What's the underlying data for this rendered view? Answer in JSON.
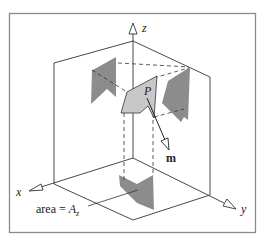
{
  "diagram": {
    "axes": {
      "x_label": "x",
      "y_label": "y",
      "z_label": "z"
    },
    "patch_label": "P",
    "vector_label": "m",
    "area_annotation": "area = ",
    "area_symbol": "A",
    "area_subscript": "z",
    "colors": {
      "frame": "#8a8a8a",
      "lines": "#333333",
      "patch_fill": "#c8c8c8",
      "projection_fill": "#8c8c8c"
    }
  }
}
